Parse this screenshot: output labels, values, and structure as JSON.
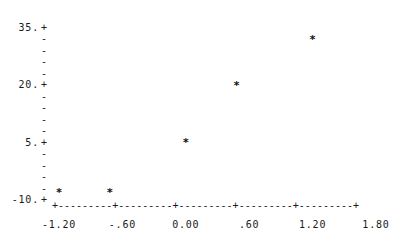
{
  "chart_data": {
    "type": "scatter",
    "title": "",
    "subtitle": "",
    "xlabel": "",
    "ylabel": "",
    "xlim": [
      -1.2,
      1.8
    ],
    "ylim": [
      -10,
      35
    ],
    "grid": false,
    "legend": null,
    "marker": "*",
    "x": [
      -1.2,
      -0.72,
      0.0,
      0.48,
      1.2
    ],
    "y": [
      -8,
      -8,
      5,
      20,
      32
    ],
    "points": [
      {
        "x": -1.2,
        "y": -8,
        "marker": "*"
      },
      {
        "x": -0.72,
        "y": -8,
        "marker": "*"
      },
      {
        "x": 0.0,
        "y": 5,
        "marker": "*"
      },
      {
        "x": 0.48,
        "y": 20,
        "marker": "*"
      },
      {
        "x": 1.2,
        "y": 32,
        "marker": "*"
      }
    ],
    "x_ticks": [
      {
        "value": -1.2,
        "label": "-1.20"
      },
      {
        "value": -0.6,
        "label": "-.60"
      },
      {
        "value": 0.0,
        "label": "0.00"
      },
      {
        "value": 0.6,
        "label": ".60"
      },
      {
        "value": 1.2,
        "label": "1.20"
      },
      {
        "value": 1.8,
        "label": "1.80"
      }
    ],
    "y_ticks": [
      {
        "value": 35,
        "label": "35.",
        "major": true
      },
      {
        "value": 32,
        "label": "",
        "major": false
      },
      {
        "value": 29,
        "label": "",
        "major": false
      },
      {
        "value": 26,
        "label": "",
        "major": false
      },
      {
        "value": 23,
        "label": "",
        "major": false
      },
      {
        "value": 20,
        "label": "20.",
        "major": true
      },
      {
        "value": 17,
        "label": "",
        "major": false
      },
      {
        "value": 14,
        "label": "",
        "major": false
      },
      {
        "value": 11,
        "label": "",
        "major": false
      },
      {
        "value": 8,
        "label": "",
        "major": false
      },
      {
        "value": 5,
        "label": "5.",
        "major": true
      },
      {
        "value": 2,
        "label": "",
        "major": false
      },
      {
        "value": -1,
        "label": "",
        "major": false
      },
      {
        "value": -4,
        "label": "",
        "major": false
      },
      {
        "value": -7,
        "label": "",
        "major": false
      },
      {
        "value": -10,
        "label": "-10.",
        "major": true
      }
    ],
    "axis_glyphs": {
      "major_tick": "+",
      "minor_tick": "-",
      "axis_fill": "-",
      "x_axis_line": "+---------+---------+---------+---------+---------+"
    },
    "colors": {
      "background": "#ffffff",
      "ink": "#1a1a1a",
      "marker": "#111111"
    }
  }
}
